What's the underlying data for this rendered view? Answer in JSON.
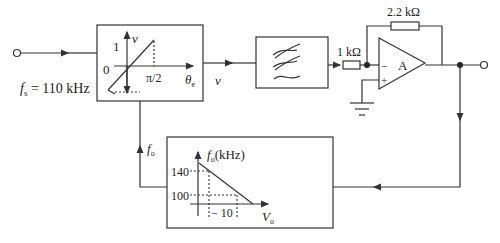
{
  "input": {
    "fs_label": "f",
    "fs_sub": "s",
    "fs_value": " = 110 kHz"
  },
  "phase_detector": {
    "y_axis_label": "v",
    "y_tick_1": "1",
    "origin": "0",
    "x_tick": "π/2",
    "x_axis_label": "θ",
    "x_axis_sub": "e"
  },
  "signal_v": "v",
  "amplifier": {
    "input_resistor": "1 kΩ",
    "feedback_resistor": "2.2 kΩ",
    "gain_label": "A",
    "minus": "−",
    "plus": "+"
  },
  "vco": {
    "fo_label": "f",
    "fo_sub": "o",
    "y_axis_label": "f",
    "y_axis_sub": "o",
    "y_axis_unit": "(kHz)",
    "tick_140": "140",
    "tick_100": "100",
    "tick_vo": "− 10",
    "x_axis_label": "V",
    "x_axis_sub": "o"
  },
  "colors": {
    "stroke": "#333333"
  }
}
